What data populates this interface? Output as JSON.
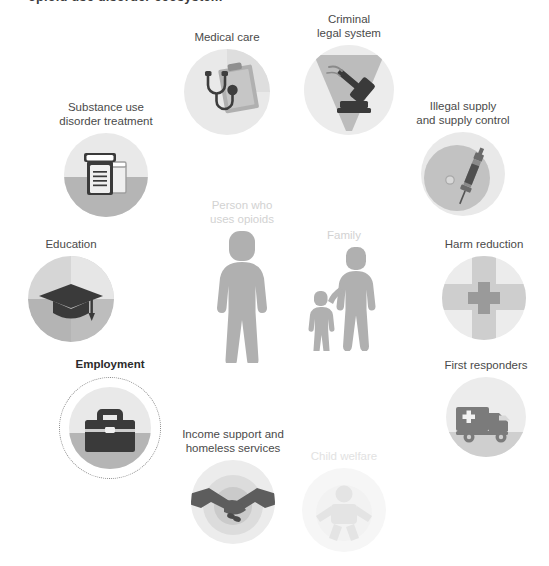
{
  "figure": {
    "cut_title_fragment": "opioid use disorder ecosystem",
    "center_focus": "Person who uses opioids",
    "highlighted_node": "Employment"
  },
  "palette": {
    "background": "#ffffff",
    "disc_light": "#e8e8e8",
    "disc_lighter": "#efefef",
    "disc_mid": "#b9b9b9",
    "disc_dark": "#9c9c9c",
    "icon_dark": "#3a3a3a",
    "icon_mid": "#5d5d5d",
    "figure_gray": "#a8a8a8",
    "label_text": "#4a4a4a",
    "label_bold": "#2b2b2b",
    "label_dim": "#e2e2e2",
    "label_mid_dim": "#d2d2d2",
    "ring_dotted": "#8a8a8a"
  },
  "nodes": [
    {
      "id": "medical-care",
      "label": "Medical care",
      "icon": "stethoscope-clipboard-icon",
      "state": "normal",
      "x": 172,
      "y": 30,
      "disc": 86
    },
    {
      "id": "criminal-legal-system",
      "label": "Criminal\nlegal system",
      "icon": "gavel-icon",
      "state": "normal",
      "x": 296,
      "y": 12,
      "disc": 90
    },
    {
      "id": "substance-use-disorder-treatment",
      "label": "Substance use\ndisorder treatment",
      "icon": "pill-bottle-icon",
      "state": "normal",
      "x": 52,
      "y": 100,
      "disc": 84
    },
    {
      "id": "illegal-supply-and-supply-control",
      "label": "Illegal supply\nand supply control",
      "icon": "syringe-icon",
      "state": "normal",
      "x": 406,
      "y": 99,
      "disc": 84
    },
    {
      "id": "education",
      "label": "Education",
      "icon": "graduation-cap-icon",
      "state": "normal",
      "x": 18,
      "y": 237,
      "disc": 86
    },
    {
      "id": "harm-reduction",
      "label": "Harm reduction",
      "icon": "medical-cross-icon",
      "state": "normal",
      "x": 440,
      "y": 237,
      "disc": 84
    },
    {
      "id": "employment",
      "label": "Employment",
      "icon": "briefcase-icon",
      "state": "highlighted",
      "x": 60,
      "y": 357,
      "disc": 82,
      "ring": 100
    },
    {
      "id": "first-responders",
      "label": "First responders",
      "icon": "ambulance-icon",
      "state": "normal",
      "x": 440,
      "y": 358,
      "disc": 80
    },
    {
      "id": "income-support-and-homeless-services",
      "label": "Income support and\nhomeless services",
      "icon": "handshake-icon",
      "state": "normal",
      "x": 175,
      "y": 427,
      "disc": 84
    },
    {
      "id": "child-welfare",
      "label": "Child welfare",
      "icon": "baby-icon",
      "state": "dim",
      "x": 302,
      "y": 449,
      "disc": 84
    }
  ],
  "center_figures": [
    {
      "id": "person-who-uses-opioids",
      "label": "Person who\nuses opioids",
      "icon": "adult-person-icon",
      "state": "mid-dim",
      "x": 190,
      "y": 198
    },
    {
      "id": "family",
      "label": "Family",
      "icon": "adult-and-child-icon",
      "state": "mid-dim",
      "x": 300,
      "y": 228
    }
  ]
}
